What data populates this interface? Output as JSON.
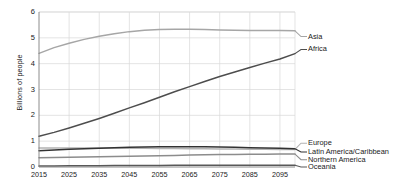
{
  "chart_data": {
    "type": "line",
    "title": "",
    "subtitle": "",
    "xlabel": "",
    "ylabel": "Billions of people",
    "xlim": [
      2015,
      2100
    ],
    "ylim": [
      0,
      6
    ],
    "yticks": [
      "0",
      "1",
      "2",
      "3",
      "4",
      "5",
      "6"
    ],
    "ytick_values": [
      0,
      1,
      2,
      3,
      4,
      5,
      6
    ],
    "xticks": [
      "2015",
      "2025",
      "2035",
      "2045",
      "2055",
      "2065",
      "2075",
      "2085",
      "2095"
    ],
    "xtick_values": [
      2015,
      2025,
      2035,
      2045,
      2055,
      2065,
      2075,
      2085,
      2095
    ],
    "grid": true,
    "grid_color": "#d9d9d9",
    "legend_position": "right-inline",
    "x": [
      2015,
      2020,
      2025,
      2030,
      2035,
      2040,
      2045,
      2050,
      2055,
      2060,
      2065,
      2070,
      2075,
      2080,
      2085,
      2090,
      2095,
      2100
    ],
    "series": [
      {
        "name": "Asia",
        "color": "#a6a6a6",
        "label_y_value": 5.05,
        "values": [
          4.4,
          4.62,
          4.79,
          4.94,
          5.06,
          5.16,
          5.24,
          5.29,
          5.32,
          5.33,
          5.33,
          5.32,
          5.3,
          5.29,
          5.28,
          5.28,
          5.28,
          5.27
        ]
      },
      {
        "name": "Africa",
        "color": "#4d4d4d",
        "label_y_value": 4.55,
        "values": [
          1.19,
          1.34,
          1.51,
          1.69,
          1.88,
          2.08,
          2.29,
          2.49,
          2.7,
          2.91,
          3.11,
          3.31,
          3.5,
          3.68,
          3.85,
          4.02,
          4.18,
          4.39
        ]
      },
      {
        "name": "Europe",
        "color": "#b3b3b3",
        "label_y_value": 0.92,
        "values": [
          0.74,
          0.74,
          0.74,
          0.74,
          0.74,
          0.74,
          0.73,
          0.73,
          0.72,
          0.72,
          0.71,
          0.71,
          0.7,
          0.7,
          0.69,
          0.69,
          0.68,
          0.68
        ]
      },
      {
        "name": "Latin America/Caribbean",
        "color": "#333333",
        "label_y_value": 0.58,
        "values": [
          0.63,
          0.66,
          0.69,
          0.71,
          0.73,
          0.75,
          0.76,
          0.77,
          0.78,
          0.78,
          0.78,
          0.78,
          0.77,
          0.76,
          0.75,
          0.74,
          0.73,
          0.71
        ]
      },
      {
        "name": "Northern America",
        "color": "#8c8c8c",
        "label_y_value": 0.28,
        "values": [
          0.36,
          0.37,
          0.38,
          0.39,
          0.4,
          0.41,
          0.42,
          0.43,
          0.44,
          0.45,
          0.46,
          0.47,
          0.48,
          0.48,
          0.49,
          0.49,
          0.5,
          0.5
        ]
      },
      {
        "name": "Oceania",
        "color": "#595959",
        "label_y_value": 0.0,
        "values": [
          0.04,
          0.04,
          0.05,
          0.05,
          0.05,
          0.06,
          0.06,
          0.06,
          0.06,
          0.07,
          0.07,
          0.07,
          0.07,
          0.07,
          0.07,
          0.07,
          0.07,
          0.07
        ]
      }
    ]
  }
}
